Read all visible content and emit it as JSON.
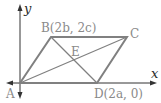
{
  "diagram": {
    "type": "coordinate-geometry-parallelogram",
    "axes": {
      "x_label": "x",
      "y_label": "y"
    },
    "points": {
      "A": {
        "label": "A"
      },
      "B": {
        "label": "B(2b, 2c)"
      },
      "C": {
        "label": "C"
      },
      "D": {
        "label": "D(2a, 0)"
      },
      "E": {
        "label": "E"
      }
    },
    "colors": {
      "shape": "#808080",
      "axis": "#333333",
      "label": "#8a8a8a"
    }
  }
}
